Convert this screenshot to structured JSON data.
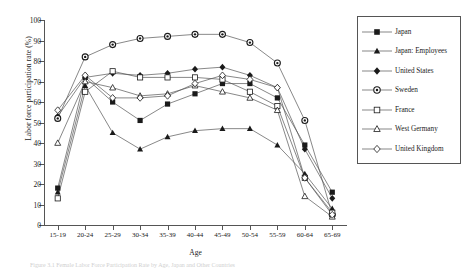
{
  "figure": {
    "caption": "Figure 3.1  Female Labor Force Participation Rate by Age, Japan and Other Countries"
  },
  "chart_data": {
    "type": "line",
    "title": "",
    "xlabel": "Age",
    "ylabel": "Labor force participation rate (%)",
    "categories": [
      "15-19",
      "20-24",
      "25-29",
      "30-34",
      "35-39",
      "40-44",
      "45-49",
      "50-54",
      "55-59",
      "60-64",
      "65-69"
    ],
    "ylim": [
      0,
      100
    ],
    "ytick_step": 10,
    "yticks": [
      0,
      10,
      20,
      30,
      40,
      50,
      60,
      70,
      80,
      90,
      100
    ],
    "grid": false,
    "legend_position": "right",
    "series": [
      {
        "name": "Japan",
        "marker": "filled-square",
        "values": [
          18,
          72,
          60,
          51,
          59,
          64,
          69,
          69,
          62,
          39,
          16
        ]
      },
      {
        "name": "Japan: Employees",
        "marker": "filled-triangle",
        "values": [
          16,
          68,
          45,
          37,
          43,
          46,
          47,
          47,
          39,
          25,
          8
        ]
      },
      {
        "name": "United States",
        "marker": "filled-diamond",
        "values": [
          53,
          72,
          74,
          73,
          74,
          76,
          77,
          73,
          67,
          37,
          13
        ]
      },
      {
        "name": "Sweden",
        "marker": "circle-dot",
        "values": [
          52,
          82,
          88,
          91,
          92,
          93,
          93,
          89,
          79,
          51,
          5
        ]
      },
      {
        "name": "France",
        "marker": "open-square",
        "values": [
          13,
          65,
          75,
          72,
          72,
          72,
          71,
          65,
          58,
          23,
          6
        ]
      },
      {
        "name": "West Germany",
        "marker": "open-triangle",
        "values": [
          40,
          70,
          67,
          63,
          64,
          68,
          65,
          62,
          56,
          14,
          4
        ]
      },
      {
        "name": "United Kingdom",
        "marker": "open-diamond",
        "values": [
          56,
          73,
          62,
          62,
          63,
          69,
          73,
          71,
          67,
          23,
          5
        ]
      }
    ]
  },
  "legend": {
    "items": [
      {
        "label": "Japan"
      },
      {
        "label": "Japan: Employees"
      },
      {
        "label": "United States"
      },
      {
        "label": "Sweden"
      },
      {
        "label": "France"
      },
      {
        "label": "West Germany"
      },
      {
        "label": "United Kingdom"
      }
    ]
  }
}
